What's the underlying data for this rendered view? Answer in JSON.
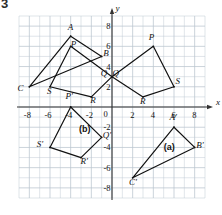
{
  "figure": {
    "number": "3"
  },
  "axes": {
    "x_label": "x",
    "y_label": "y",
    "xlim": [
      -9,
      9
    ],
    "ylim": [
      -9,
      9
    ],
    "grid_step": 1,
    "tick_step": 2,
    "x_ticks": [
      "-8",
      "-6",
      "-4",
      "-2",
      "0",
      "2",
      "4",
      "6",
      "8"
    ],
    "x_tick_values": [
      -8,
      -6,
      -4,
      -2,
      0,
      2,
      4,
      6,
      8
    ],
    "y_ticks": [
      "8",
      "6",
      "4",
      "2",
      "0",
      "-2",
      "-4",
      "-6",
      "-8"
    ],
    "y_tick_values": [
      8,
      6,
      4,
      2,
      0,
      -2,
      -4,
      -6,
      -8
    ],
    "grid_color": "#b9c4cf",
    "axis_color": "#333333",
    "shape_color": "#111111"
  },
  "chart_data": {
    "type": "scatter",
    "title": "",
    "xlabel": "x",
    "ylabel": "y",
    "xlim": [
      -9,
      9
    ],
    "ylim": [
      -9,
      9
    ],
    "grid": true,
    "legend": "none",
    "shapes": [
      {
        "name": "triangle-ABC",
        "kind": "polygon",
        "closed": true,
        "vertices": [
          {
            "label": "A",
            "x": -4,
            "y": 7,
            "lx": -0.1,
            "ly": 0.8
          },
          {
            "label": "B",
            "x": -1,
            "y": 5,
            "lx": 0.35,
            "ly": 0.25
          },
          {
            "label": "C",
            "x": -8,
            "y": 2,
            "lx": -0.95,
            "ly": -0.25
          }
        ]
      },
      {
        "name": "quadrilateral-PQRS-left",
        "kind": "polygon",
        "closed": true,
        "vertices": [
          {
            "label": "P",
            "x": -4,
            "y": 6,
            "lx": 0.2,
            "ly": 0.15
          },
          {
            "label": "Q",
            "x": 0,
            "y": 3,
            "lx": -0.9,
            "ly": 0.25
          },
          {
            "label": "R",
            "x": -2,
            "y": 1,
            "lx": 0.1,
            "ly": -0.45
          },
          {
            "label": "S",
            "x": -6,
            "y": 2,
            "lx": -0.1,
            "ly": -0.5
          }
        ]
      },
      {
        "name": "quadrilateral-PQRS-right",
        "kind": "polygon",
        "closed": true,
        "vertices": [
          {
            "label": "P",
            "x": 4,
            "y": 6,
            "lx": -0.25,
            "ly": 0.85
          },
          {
            "label": "Q",
            "x": 0,
            "y": 3,
            "lx": 0.25,
            "ly": 0.25
          },
          {
            "label": "R",
            "x": 3,
            "y": 1,
            "lx": -0.1,
            "ly": -0.5
          },
          {
            "label": "S",
            "x": 6,
            "y": 2,
            "lx": 0.35,
            "ly": 0.45
          }
        ]
      },
      {
        "name": "quadrilateral-P1Q1R1S1",
        "kind": "polygon",
        "closed": true,
        "case_label": "(b)",
        "case_x": -3.2,
        "case_y": -2.3,
        "vertices": [
          {
            "label": "P'",
            "x": -4,
            "y": 0,
            "lx": -0.3,
            "ly": 0.95
          },
          {
            "label": "Q'",
            "x": -1,
            "y": -3,
            "lx": 0.3,
            "ly": 0.1
          },
          {
            "label": "R'",
            "x": -3,
            "y": -5,
            "lx": 0.15,
            "ly": -0.45
          },
          {
            "label": "S'",
            "x": -6,
            "y": -4,
            "lx": -1.1,
            "ly": 0.2
          }
        ]
      },
      {
        "name": "triangle-A1B1C1",
        "kind": "polygon",
        "closed": true,
        "case_label": "(a)",
        "case_x": 5.0,
        "case_y": -4.1,
        "vertices": [
          {
            "label": "A'",
            "x": 6,
            "y": -2,
            "lx": -0.25,
            "ly": 0.9
          },
          {
            "label": "B'",
            "x": 8,
            "y": -4,
            "lx": 0.35,
            "ly": 0.1
          },
          {
            "label": "C'",
            "x": 2,
            "y": -7,
            "lx": -0.15,
            "ly": -0.5
          }
        ]
      }
    ]
  }
}
